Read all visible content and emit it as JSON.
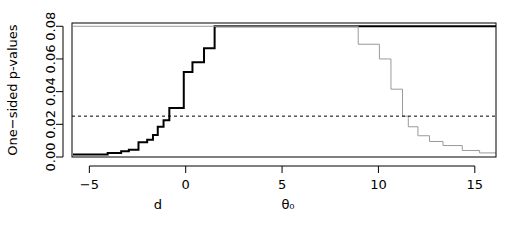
{
  "chart_data": {
    "type": "line",
    "title": "",
    "subtitle": "",
    "ylabel": "One−sided p-values",
    "xlabel_left": "d",
    "xlabel_right": "θ₀",
    "grid": false,
    "legend": "none",
    "xlim": [
      -5.9,
      16.1
    ],
    "ylim": [
      0.0,
      0.082
    ],
    "x_ticks": [
      -5,
      0,
      5,
      10,
      15
    ],
    "x_tick_labels": [
      "−5",
      "0",
      "5",
      "10",
      "15"
    ],
    "y_ticks": [
      0.0,
      0.02,
      0.04,
      0.06,
      0.08
    ],
    "y_tick_labels": [
      "0.00",
      "0.02",
      "0.04",
      "0.06",
      "0.08"
    ],
    "annotations": [
      {
        "name": "alpha-threshold-line",
        "style": "dashed",
        "orientation": "horizontal",
        "y": 0.025,
        "color": "#000000"
      }
    ],
    "series": [
      {
        "name": "left-step-curve",
        "style": "step",
        "color": "#000000",
        "linewidth": 2,
        "points": [
          [
            -5.85,
            0.0015
          ],
          [
            -4.05,
            0.0015
          ],
          [
            -4.05,
            0.0025
          ],
          [
            -3.35,
            0.0025
          ],
          [
            -3.35,
            0.0035
          ],
          [
            -2.95,
            0.0035
          ],
          [
            -2.95,
            0.0045
          ],
          [
            -2.45,
            0.0045
          ],
          [
            -2.45,
            0.009
          ],
          [
            -2.0,
            0.009
          ],
          [
            -2.0,
            0.0105
          ],
          [
            -1.7,
            0.0105
          ],
          [
            -1.7,
            0.0135
          ],
          [
            -1.45,
            0.0135
          ],
          [
            -1.45,
            0.0185
          ],
          [
            -1.15,
            0.0185
          ],
          [
            -1.15,
            0.0225
          ],
          [
            -0.85,
            0.0225
          ],
          [
            -0.85,
            0.03
          ],
          [
            -0.1,
            0.03
          ],
          [
            -0.1,
            0.052
          ],
          [
            0.35,
            0.052
          ],
          [
            0.35,
            0.058
          ],
          [
            0.95,
            0.058
          ],
          [
            0.95,
            0.0665
          ],
          [
            1.5,
            0.0665
          ],
          [
            1.5,
            0.08
          ],
          [
            16.1,
            0.08
          ]
        ]
      },
      {
        "name": "right-step-curve",
        "style": "step",
        "color": "#9a9a9a",
        "linewidth": 1,
        "points": [
          [
            -5.85,
            0.08
          ],
          [
            8.95,
            0.08
          ],
          [
            8.95,
            0.069
          ],
          [
            10.05,
            0.069
          ],
          [
            10.05,
            0.06
          ],
          [
            10.65,
            0.06
          ],
          [
            10.65,
            0.0415
          ],
          [
            11.25,
            0.0415
          ],
          [
            11.25,
            0.025
          ],
          [
            11.55,
            0.025
          ],
          [
            11.55,
            0.0185
          ],
          [
            12.05,
            0.0185
          ],
          [
            12.05,
            0.013
          ],
          [
            12.65,
            0.013
          ],
          [
            12.65,
            0.0095
          ],
          [
            13.35,
            0.0095
          ],
          [
            13.35,
            0.007
          ],
          [
            14.35,
            0.007
          ],
          [
            14.35,
            0.004
          ],
          [
            15.25,
            0.004
          ],
          [
            15.25,
            0.0025
          ],
          [
            16.1,
            0.0025
          ]
        ]
      }
    ]
  }
}
